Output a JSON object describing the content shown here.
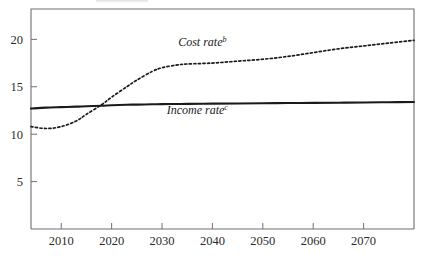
{
  "chart_data": {
    "type": "line",
    "title": "",
    "xlabel": "",
    "ylabel": "",
    "xlim": [
      2004,
      2080
    ],
    "ylim": [
      0,
      23.2
    ],
    "grid": false,
    "legend_position": "inline-annotations",
    "xticks": [
      2010,
      2020,
      2030,
      2040,
      2050,
      2060,
      2070
    ],
    "xtick_labels": [
      "2010",
      "2020",
      "2030",
      "2040",
      "2050",
      "2060",
      "2070"
    ],
    "yticks": [
      5,
      10,
      15,
      20
    ],
    "ytick_labels": [
      "5",
      "10",
      "15",
      "20"
    ],
    "x": [
      2004,
      2007,
      2010,
      2013,
      2015,
      2018,
      2020,
      2023,
      2025,
      2028,
      2030,
      2033,
      2035,
      2040,
      2045,
      2050,
      2055,
      2060,
      2065,
      2070,
      2075,
      2080
    ],
    "series": [
      {
        "name": "Cost rate",
        "superscript": "b",
        "style": "dotted",
        "label_x": 2038,
        "label_y": 19.3,
        "values": [
          10.8,
          10.6,
          10.8,
          11.4,
          12.1,
          13.1,
          13.9,
          15.0,
          15.7,
          16.6,
          17.0,
          17.3,
          17.4,
          17.5,
          17.7,
          17.9,
          18.2,
          18.6,
          19.0,
          19.3,
          19.6,
          19.9
        ]
      },
      {
        "name": "Income rate",
        "superscript": "c",
        "style": "solid",
        "label_x": 2037,
        "label_y": 12.1,
        "values": [
          12.7,
          12.8,
          12.85,
          12.9,
          12.95,
          13.0,
          13.05,
          13.1,
          13.12,
          13.15,
          13.17,
          13.18,
          13.2,
          13.22,
          13.24,
          13.26,
          13.28,
          13.3,
          13.32,
          13.34,
          13.37,
          13.4
        ]
      }
    ]
  },
  "plot_geometry": {
    "left": 31,
    "right": 414,
    "top": 9,
    "bottom": 229
  }
}
